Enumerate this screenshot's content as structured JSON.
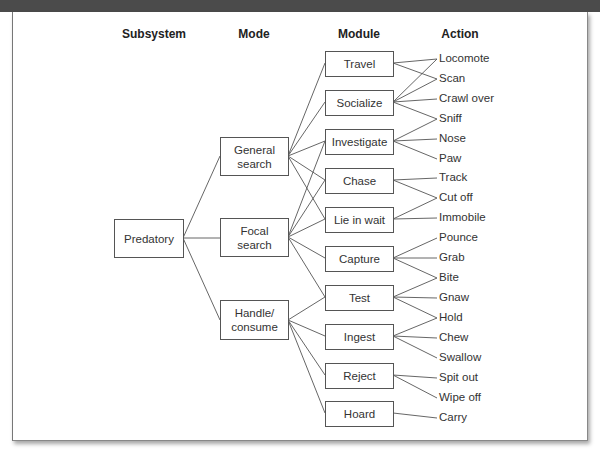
{
  "headers": {
    "subsystem": "Subsystem",
    "mode": "Mode",
    "module": "Module",
    "action": "Action"
  },
  "subsystem": {
    "label": "Predatory"
  },
  "modes": [
    {
      "label": "General search"
    },
    {
      "label": "Focal search"
    },
    {
      "label": "Handle/ consume"
    }
  ],
  "modules": [
    {
      "label": "Travel"
    },
    {
      "label": "Socialize"
    },
    {
      "label": "Investigate"
    },
    {
      "label": "Chase"
    },
    {
      "label": "Lie in wait"
    },
    {
      "label": "Capture"
    },
    {
      "label": "Test"
    },
    {
      "label": "Ingest"
    },
    {
      "label": "Reject"
    },
    {
      "label": "Hoard"
    }
  ],
  "actions": [
    {
      "label": "Locomote"
    },
    {
      "label": "Scan"
    },
    {
      "label": "Crawl over"
    },
    {
      "label": "Sniff"
    },
    {
      "label": "Nose"
    },
    {
      "label": "Paw"
    },
    {
      "label": "Track"
    },
    {
      "label": "Cut off"
    },
    {
      "label": "Immobile"
    },
    {
      "label": "Pounce"
    },
    {
      "label": "Grab"
    },
    {
      "label": "Bite"
    },
    {
      "label": "Gnaw"
    },
    {
      "label": "Hold"
    },
    {
      "label": "Chew"
    },
    {
      "label": "Swallow"
    },
    {
      "label": "Spit out"
    },
    {
      "label": "Wipe off"
    },
    {
      "label": "Carry"
    }
  ],
  "connections": {
    "mode_modules": {
      "General search": [
        "Travel",
        "Socialize",
        "Investigate",
        "Chase",
        "Lie in wait"
      ],
      "Focal search": [
        "Investigate",
        "Chase",
        "Lie in wait",
        "Capture",
        "Test"
      ],
      "Handle/ consume": [
        "Test",
        "Ingest",
        "Reject",
        "Hoard"
      ]
    },
    "module_actions": {
      "Travel": [
        "Locomote",
        "Scan"
      ],
      "Socialize": [
        "Locomote",
        "Scan",
        "Crawl over",
        "Sniff"
      ],
      "Investigate": [
        "Sniff",
        "Nose",
        "Paw"
      ],
      "Chase": [
        "Track",
        "Cut off"
      ],
      "Lie in wait": [
        "Cut off",
        "Immobile"
      ],
      "Capture": [
        "Pounce",
        "Grab",
        "Bite"
      ],
      "Test": [
        "Bite",
        "Gnaw",
        "Hold"
      ],
      "Ingest": [
        "Hold",
        "Chew",
        "Swallow"
      ],
      "Reject": [
        "Spit out",
        "Wipe off"
      ],
      "Hoard": [
        "Carry"
      ]
    }
  },
  "colors": {
    "topbar": "#4b4b4b",
    "line": "#555555",
    "text": "#333333"
  }
}
